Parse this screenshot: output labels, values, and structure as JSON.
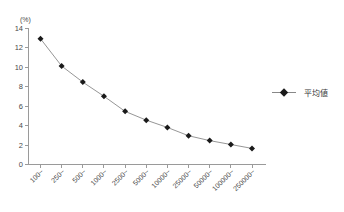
{
  "chart_data": {
    "type": "line",
    "title": "",
    "subtitle": "",
    "xlabel": "",
    "ylabel": "(%)",
    "ylim": [
      0,
      14
    ],
    "ytick_step": 2,
    "yticks": [
      "0",
      "2",
      "4",
      "6",
      "8",
      "10",
      "12",
      "14"
    ],
    "grid": false,
    "legend_position": "right",
    "categories": [
      "100",
      "250",
      "500",
      "1000",
      "2500",
      "5000",
      "10000",
      "25000",
      "50000",
      "100000",
      "250000"
    ],
    "category_suffix": "~",
    "series": [
      {
        "name": "平均値",
        "marker": "diamond",
        "color": "#1a1a1a",
        "line_color": "#8a8a8a",
        "values": [
          12.9,
          10.1,
          8.45,
          7.0,
          5.45,
          4.55,
          3.8,
          2.95,
          2.45,
          2.05,
          1.65
        ]
      }
    ]
  },
  "legend": {
    "entries": [
      {
        "label": "平均値"
      }
    ]
  },
  "axes": {
    "y_unit_label": "(%)"
  },
  "colors": {
    "axis": "#9a9a9a",
    "marker": "#1a1a1a",
    "line": "#8a8a8a",
    "text": "#4a4a4a",
    "background": "#ffffff"
  }
}
